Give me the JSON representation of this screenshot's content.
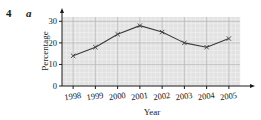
{
  "question": {
    "number": "4",
    "part": "a"
  },
  "chart_data": {
    "type": "line",
    "title": "",
    "xlabel": "Year",
    "ylabel": "Percentage",
    "categories": [
      "1998",
      "1999",
      "2000",
      "2001",
      "2002",
      "2003",
      "2004",
      "2005"
    ],
    "values": [
      14,
      18,
      24,
      28,
      25,
      20,
      18,
      22
    ],
    "series": [
      {
        "name": "Percentage",
        "values": [
          14,
          18,
          24,
          28,
          25,
          20,
          18,
          22
        ]
      }
    ],
    "ylim": [
      0,
      32
    ],
    "yticks": [
      "0",
      "10",
      "20",
      "30"
    ],
    "ytick_values": [
      0,
      10,
      20,
      30
    ],
    "xtick_labels": [
      "1998",
      "1999",
      "2000",
      "2001",
      "2002",
      "2003",
      "2004",
      "2005"
    ],
    "grid": true,
    "legend": "none",
    "marker": "x",
    "line_color": "#3b3b3b",
    "marker_color": "#3b3b3b",
    "plot_bg_color": "#e2e2e2",
    "grid_color": "#f2f2f2",
    "grid_major_color": "#b8b8b8",
    "axis_color": "#1a1a1a"
  }
}
